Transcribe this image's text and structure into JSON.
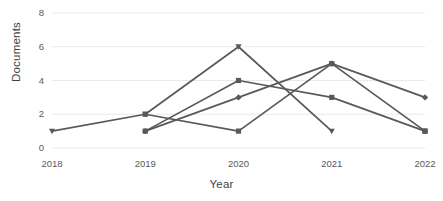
{
  "chart_data": {
    "type": "line",
    "title": "",
    "subtitle": "",
    "xlabel": "Year",
    "ylabel": "Documents",
    "categories": [
      "2018",
      "2019",
      "2020",
      "2021",
      "2022"
    ],
    "x": [
      2018,
      2019,
      2020,
      2021,
      2022
    ],
    "xlim": [
      2018,
      2022
    ],
    "ylim": [
      0,
      8
    ],
    "yticks": [
      0,
      2,
      4,
      6,
      8
    ],
    "ytick_labels": [
      "0",
      "2",
      "4",
      "6",
      "8"
    ],
    "xtick_labels": [
      "2018",
      "2019",
      "2020",
      "2021",
      "2022"
    ],
    "grid": true,
    "grid_axis": "y",
    "legend": false,
    "legend_position": "none",
    "line_color": "#595959",
    "grid_color": "#e9e9e9",
    "axis_text_color": "#595959",
    "series": [
      {
        "name": "Series 1",
        "marker": "triangle",
        "values": [
          1,
          2,
          6,
          1,
          null
        ]
      },
      {
        "name": "Series 2",
        "marker": "square",
        "values": [
          null,
          1,
          4,
          3,
          1
        ]
      },
      {
        "name": "Series 3",
        "marker": "diamond",
        "values": [
          null,
          1,
          3,
          5,
          3
        ]
      },
      {
        "name": "Series 4",
        "marker": "square",
        "values": [
          null,
          2,
          1,
          5,
          1
        ]
      }
    ]
  },
  "axes": {
    "y_title": "Documents",
    "x_title": "Year"
  }
}
